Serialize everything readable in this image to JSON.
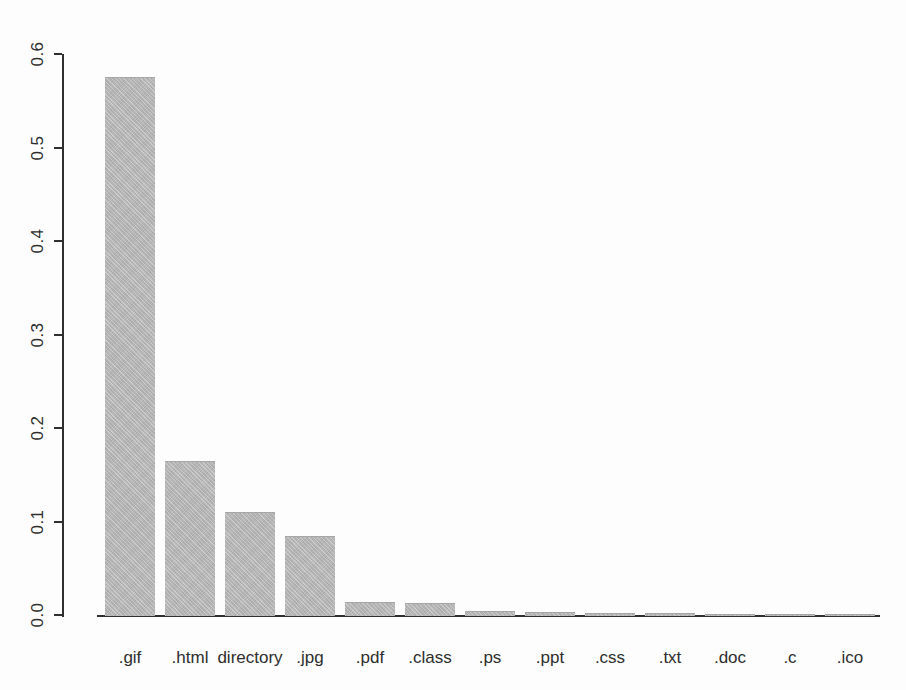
{
  "page": {
    "background_color": "#fdfdfd"
  },
  "chart_data": {
    "type": "bar",
    "title": "",
    "xlabel": "",
    "ylabel": "",
    "categories": [
      ".gif",
      ".html",
      "directory",
      ".jpg",
      ".pdf",
      ".class",
      ".ps",
      ".ppt",
      ".css",
      ".txt",
      ".doc",
      ".c",
      ".ico"
    ],
    "values": [
      0.575,
      0.165,
      0.11,
      0.085,
      0.014,
      0.013,
      0.004,
      0.0035,
      0.0025,
      0.002,
      0.0015,
      0.001,
      0.0005
    ],
    "ylim": [
      0.0,
      0.6
    ],
    "yticks": [
      0.0,
      0.1,
      0.2,
      0.3,
      0.4,
      0.5,
      0.6
    ],
    "ytick_labels": [
      "0.0",
      "0.1",
      "0.2",
      "0.3",
      "0.4",
      "0.5",
      "0.6"
    ],
    "ytick_label_rotation_deg": -90,
    "grid": false,
    "legend": "none",
    "bar_color": "#b8b8b8",
    "axis_color": "#2f2f2f",
    "text_color": "#2e2e2e"
  }
}
